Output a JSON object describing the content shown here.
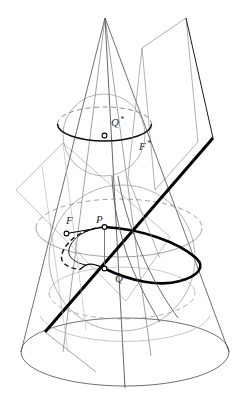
{
  "figure": {
    "canvas": {
      "width": 252,
      "height": 409,
      "background": "#ffffff"
    },
    "colors": {
      "thin_line": "#4a4a4a",
      "faint_line": "#8c8c8c",
      "bold_line": "#000000",
      "dashed_line": "#7d7d7d",
      "label_text": "#2a2a2a",
      "point_fill": "#ffffff",
      "point_stroke": "#000000"
    },
    "labels": [
      {
        "id": "label-q-star",
        "text": "Q",
        "star": "*",
        "x": 111,
        "y": 126
      },
      {
        "id": "label-f-star",
        "text": "F",
        "star": "*",
        "x": 139,
        "y": 150
      },
      {
        "id": "label-f",
        "text": "F",
        "star": "",
        "x": 66,
        "y": 224
      },
      {
        "id": "label-p",
        "text": "P",
        "star": "",
        "x": 96,
        "y": 223
      },
      {
        "id": "label-q",
        "text": "Q",
        "star": "",
        "x": 115,
        "y": 282
      }
    ],
    "points": [
      {
        "id": "point-q-star",
        "label": "Q*",
        "x": 104.5,
        "y": 135.5,
        "r": 2.4
      },
      {
        "id": "point-f",
        "label": "F",
        "x": 66.5,
        "y": 233.5,
        "r": 2.4
      },
      {
        "id": "point-p",
        "label": "P",
        "x": 104.5,
        "y": 227.0,
        "r": 2.4
      },
      {
        "id": "point-q",
        "label": "Q",
        "x": 104.5,
        "y": 268.5,
        "r": 2.4
      }
    ],
    "elements": {
      "cone_apex": {
        "x": 105,
        "y": 18
      },
      "cone_base_ellipse": {
        "cx": 125,
        "cy": 352,
        "rx": 105,
        "ry": 34
      },
      "upper_sphere": {
        "cx": 104,
        "cy": 135,
        "r": 41
      },
      "lower_sphere": {
        "cx": 122,
        "cy": 258,
        "r": 73
      },
      "upper_tangent_circle": {
        "cx": 104,
        "cy": 124,
        "rx": 47,
        "ry": 17
      },
      "lower_tangent_circle": {
        "cx": 119,
        "cy": 228,
        "rx": 83,
        "ry": 29
      },
      "axis": {
        "x1": 105,
        "y1": 18,
        "x2": 125,
        "y2": 388
      },
      "cutting_plane_line": {
        "x1": 45,
        "y1": 332,
        "x2": 205,
        "y2": 148
      }
    },
    "icon_names": [
      "cone-outline-icon",
      "sphere-outline-icon",
      "dashed-ellipse-icon",
      "cutting-plane-icon",
      "focus-point-icon",
      "axis-line-icon"
    ]
  }
}
